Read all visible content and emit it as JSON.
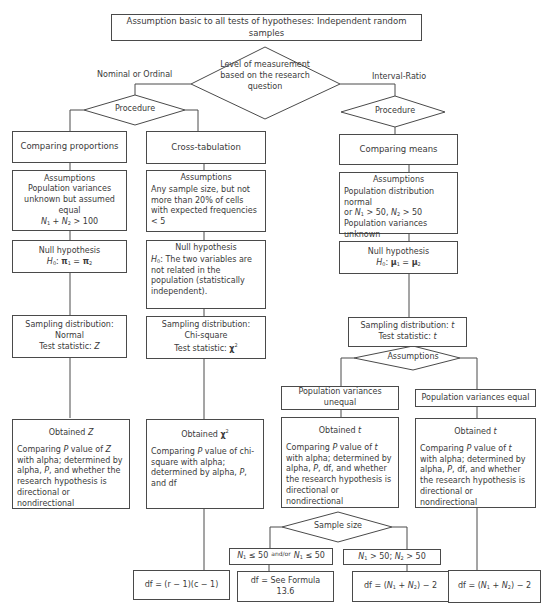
{
  "header": {
    "title": "Assumption basic to all tests of hypotheses: Independent random samples"
  },
  "decision_root": {
    "text": "Level of measurement based on the research question",
    "branch_left": "Nominal or Ordinal",
    "branch_right": "Interval-Ratio"
  },
  "procedure_left": {
    "text": "Procedure"
  },
  "procedure_right": {
    "text": "Procedure"
  },
  "col_proportions": {
    "title": "Comparing proportions",
    "assumptions_head": "Assumptions",
    "assumptions_body": "Population variances unknown but assumed equal",
    "assumptions_formula": "N₁ + N₂ > 100",
    "null_head": "Null hypothesis",
    "null_formula": "H₀: π₁ = π₂",
    "sampling_head": "Sampling distribution:",
    "sampling_dist": "Normal",
    "test_stat": "Test statistic: Z",
    "obtained_head": "Obtained Z",
    "obtained_body": "Comparing P value of Z with alpha; determined by alpha, P, and whether the research hypothesis is directional or nondirectional"
  },
  "col_crosstab": {
    "title": "Cross-tabulation",
    "assumptions_head": "Assumptions",
    "assumptions_body": "Any sample size, but not more than 20% of cells with expected frequencies < 5",
    "null_head": "Null hypothesis",
    "null_body": "H₀: The two variables are not related in the population (statistically independent).",
    "sampling_head": "Sampling distribution:",
    "sampling_dist": "Chi-square",
    "test_stat": "Test statistic: χ²",
    "obtained_head": "Obtained χ²",
    "obtained_body": "Comparing P value of chi-square with alpha; determined by alpha, P, and df",
    "df": "df = (r − 1)(c − 1)"
  },
  "col_means": {
    "title": "Comparing means",
    "assumptions_head": "Assumptions",
    "assumptions_line1": "Population distribution normal",
    "assumptions_line2": "or N₁ > 50, N₂ > 50",
    "assumptions_line3": "Population variances unknown",
    "null_head": "Null hypothesis",
    "null_formula": "H₀: μ₁ = μ₂",
    "sampling_head": "Sampling distribution: t",
    "test_stat": "Test statistic: t",
    "assumptions_decision": "Assumptions"
  },
  "means_unequal": {
    "title": "Population variances unequal",
    "obtained_head": "Obtained t",
    "obtained_body": "Comparing P value of t with alpha; determined by alpha, P, df, and whether the research hypothesis is directional or nondirectional",
    "sample_size_decision": "Sample size",
    "small_condition_a": "N₁ ≤ 50",
    "small_condition_andor": "and/or",
    "small_condition_b": "N₁ ≤ 50",
    "large_condition": "N₁ > 50; N₂ > 50",
    "df_small": "df = See Formula 13.6",
    "df_large": "df = (N₁ + N₂) − 2"
  },
  "means_equal": {
    "title": "Population variances equal",
    "obtained_head": "Obtained t",
    "obtained_body": "Comparing P value of t with alpha; determined by alpha, P, df, and whether the research hypothesis is directional or nondirectional",
    "df": "df = (N₁ + N₂) − 2"
  }
}
